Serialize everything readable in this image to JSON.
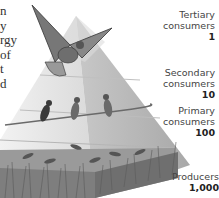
{
  "figure": {
    "side_text_fragments": [
      "n",
      "y",
      "rgy",
      "of",
      "t",
      "d"
    ],
    "levels": [
      {
        "name": "Tertiary consumers",
        "line1": "Tertiary",
        "line2": "consumers",
        "count": "1",
        "organism": "hawk"
      },
      {
        "name": "Secondary consumers",
        "line1": "Secondary",
        "line2": "consumers",
        "count": "10",
        "organism": "songbirds"
      },
      {
        "name": "Primary consumers",
        "line1": "Primary",
        "line2": "consumers",
        "count": "100",
        "organism": "grasshoppers"
      },
      {
        "name": "Producers",
        "line1": "Producers",
        "line2": "",
        "count": "1,000",
        "organism": "grass"
      }
    ],
    "colors": {
      "pyramid_light": "#e6e6e6",
      "pyramid_mid": "#cfcfcf",
      "pyramid_dark": "#b0b0b0",
      "grass": "#8a8a8a",
      "text": "#444444"
    }
  }
}
